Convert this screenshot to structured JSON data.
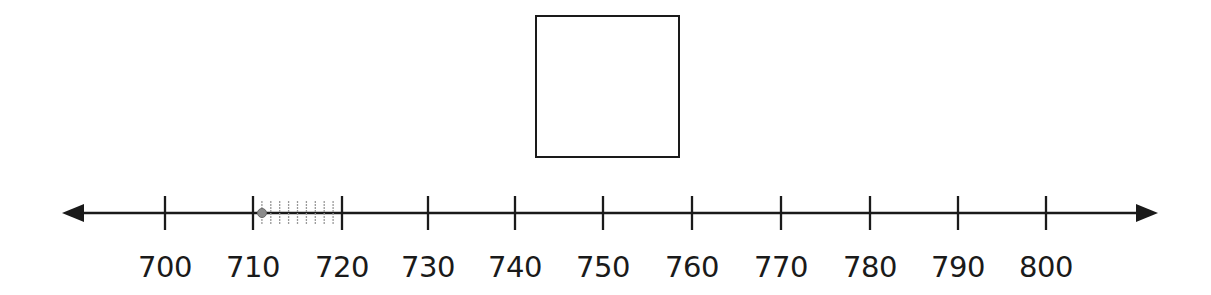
{
  "answer_box": {
    "x": 535,
    "y": 15,
    "width": 145,
    "height": 143
  },
  "number_line": {
    "y": 213,
    "x_start": 62,
    "x_end": 1158,
    "major_ticks": [
      {
        "value": "700",
        "x": 165
      },
      {
        "value": "710",
        "x": 253
      },
      {
        "value": "720",
        "x": 342
      },
      {
        "value": "730",
        "x": 428
      },
      {
        "value": "740",
        "x": 515
      },
      {
        "value": "750",
        "x": 603
      },
      {
        "value": "760",
        "x": 692
      },
      {
        "value": "770",
        "x": 781
      },
      {
        "value": "780",
        "x": 870
      },
      {
        "value": "790",
        "x": 958
      },
      {
        "value": "800",
        "x": 1046
      }
    ],
    "minor_ticks_range": [
      710,
      720
    ],
    "marked_point": {
      "value": 711,
      "x": 262
    },
    "line_color": "#1a1a1a",
    "minor_tick_color": "#9a9a9a",
    "point_color": "#8c8c8c"
  }
}
